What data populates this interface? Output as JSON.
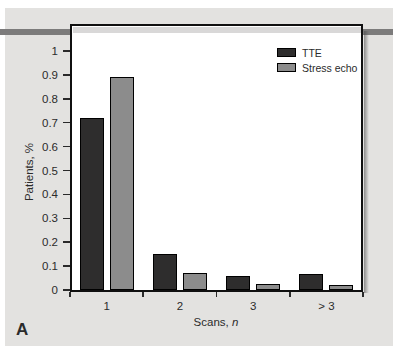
{
  "panel_label": "A",
  "colors": {
    "figure_bg": "#e3e2e0",
    "page_bg": "#ffffff",
    "rule_band": "#7c7b7b",
    "rule_band_in_frame": "#d9d8d8",
    "frame_border": "#101010",
    "axis_text": "#2b2b2b",
    "tick": "#2a2a2a",
    "tte_bar": "#2e2d2d",
    "stress_echo_bar": "#8c8c8c"
  },
  "chart_data": {
    "type": "bar",
    "title": "",
    "categories": [
      "1",
      "2",
      "3",
      "> 3"
    ],
    "series": [
      {
        "name": "TTE",
        "color": "#2e2d2d",
        "values": [
          0.72,
          0.15,
          0.06,
          0.065
        ]
      },
      {
        "name": "Stress echo",
        "color": "#8c8c8c",
        "values": [
          0.89,
          0.07,
          0.027,
          0.02
        ]
      }
    ],
    "xlabel": "Scans, n",
    "xlabel_prefix": "Scans, ",
    "xlabel_var": "n",
    "ylabel": "Patients, %",
    "ylim": [
      0,
      1.12
    ],
    "yticks": [
      0,
      0.1,
      0.2,
      0.3,
      0.4,
      0.5,
      0.6,
      0.7,
      0.8,
      0.9,
      1
    ],
    "ytick_labels": [
      "0",
      "0.1",
      "0.2",
      "0.3",
      "0.4",
      "0.5",
      "0.6",
      "0.7",
      "0.8",
      "0.9",
      "1"
    ],
    "grid": false,
    "legend_position": "top-right"
  }
}
